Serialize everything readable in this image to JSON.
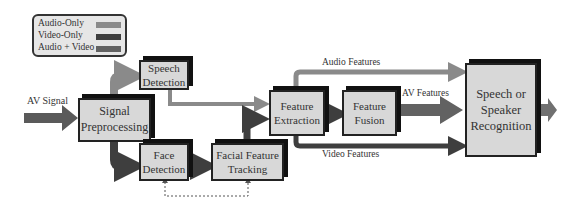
{
  "legend": {
    "items": [
      {
        "label": "Audio-Only",
        "color": "#8a8a8a"
      },
      {
        "label": "Video-Only",
        "color": "#3e3e3e"
      },
      {
        "label": "Audio + Video",
        "color": "#626262"
      }
    ]
  },
  "input_label": "AV Signal",
  "blocks": {
    "signal_preprocessing": "Signal Preprocessing",
    "speech_detection": "Speech Detection",
    "face_detection": "Face Detection",
    "facial_feature_tracking": "Facial Feature Tracking",
    "feature_extraction": "Feature Extraction",
    "feature_fusion": "Feature Fusion",
    "recognition": "Speech or Speaker Recognition"
  },
  "edge_labels": {
    "audio_features": "Audio Features",
    "av_features": "AV Features",
    "video_features": "Video Features"
  },
  "colors": {
    "audio": "#8a8a8a",
    "video": "#3e3e3e",
    "av": "#626262"
  }
}
